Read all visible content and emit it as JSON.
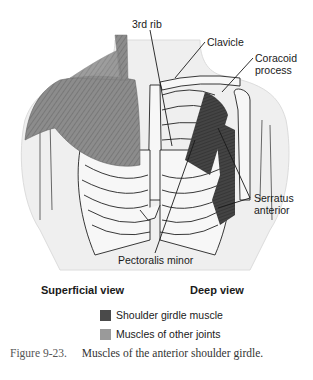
{
  "figure": {
    "labels": {
      "rib3": "3rd rib",
      "clavicle": "Clavicle",
      "coracoid_line1": "Coracoid",
      "coracoid_line2": "process",
      "serratus_line1": "Serratus",
      "serratus_line2": "anterior",
      "pec_minor": "Pectoralis minor"
    },
    "views": {
      "superficial": "Superficial view",
      "deep": "Deep view"
    },
    "legend": [
      {
        "label": "Shoulder girdle muscle",
        "color": "#4a4a4a"
      },
      {
        "label": "Muscles of other joints",
        "color": "#9a9a9a"
      }
    ],
    "caption": {
      "number": "Figure 9-23.",
      "text": "Muscles of the anterior shoulder girdle."
    },
    "colors": {
      "body_fill": "#efefef",
      "bone_fill": "#f7f7f7",
      "outline": "#222222",
      "pec_major": "#8a8a8a",
      "deep_muscle": "#3f3f3f"
    }
  }
}
